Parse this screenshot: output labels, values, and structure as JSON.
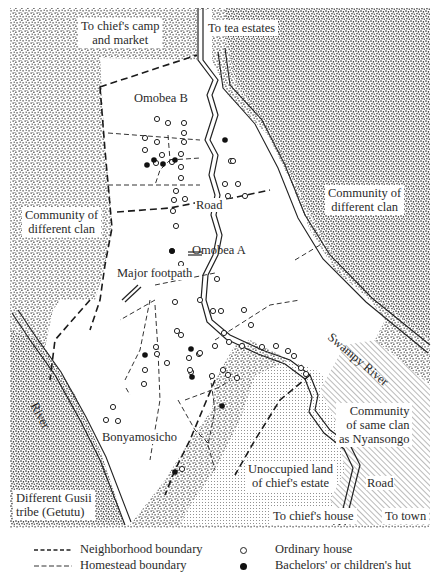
{
  "map": {
    "regions": {
      "top_left_label": "To chief's camp\nand market",
      "top_right_label": "To tea estates",
      "left_community": "Community of\ndifferent clan",
      "right_community": "Community of\ndifferent clan",
      "same_clan": "Community\nof same clan\nas Nyansongo",
      "unoccupied": "Unoccupied land\nof chief's estate",
      "to_chiefs_house": "To chief's house",
      "to_town": "To town",
      "gusii_tribe": "Different Gusii\ntribe (Getutu)"
    },
    "neighborhoods": {
      "omobea_b": "Omobea B",
      "omobea_a": "Omobea A",
      "bonyamosicho": "Bonyamosicho"
    },
    "features": {
      "road_upper": "Road",
      "road_lower": "Road",
      "major_footpath": "Major footpath",
      "swampy_river": "Swampy River",
      "river": "River"
    },
    "colors": {
      "ink": "#1a1a1a",
      "paper": "#ffffff"
    }
  },
  "legend": {
    "neighborhood_boundary": "Neighborhood boundary",
    "homestead_boundary": "Homestead boundary",
    "ordinary_house": "Ordinary house",
    "bachelors_hut": "Bachelors' or children's hut"
  },
  "houses": {
    "ordinary": [
      [
        157,
        119
      ],
      [
        168,
        123
      ],
      [
        184,
        123
      ],
      [
        184,
        133
      ],
      [
        145,
        138
      ],
      [
        157,
        142
      ],
      [
        184,
        142
      ],
      [
        145,
        150
      ],
      [
        162,
        155
      ],
      [
        181,
        154
      ],
      [
        156,
        163
      ],
      [
        172,
        162
      ],
      [
        181,
        167
      ],
      [
        181,
        178
      ],
      [
        176,
        191
      ],
      [
        174,
        200
      ],
      [
        185,
        199
      ],
      [
        173,
        211
      ],
      [
        231,
        161
      ],
      [
        233,
        161
      ],
      [
        225,
        184
      ],
      [
        238,
        184
      ],
      [
        228,
        196
      ],
      [
        245,
        196
      ],
      [
        176,
        226
      ],
      [
        172,
        251
      ],
      [
        181,
        264
      ],
      [
        217,
        279
      ],
      [
        200,
        300
      ],
      [
        175,
        302
      ],
      [
        177,
        331
      ],
      [
        181,
        335
      ],
      [
        213,
        311
      ],
      [
        221,
        311
      ],
      [
        157,
        354
      ],
      [
        167,
        363
      ],
      [
        215,
        346
      ],
      [
        199,
        354
      ],
      [
        229,
        342
      ],
      [
        223,
        370
      ],
      [
        228,
        375
      ],
      [
        212,
        376
      ],
      [
        200,
        353
      ],
      [
        191,
        372
      ],
      [
        189,
        358
      ],
      [
        190,
        370
      ],
      [
        244,
        310
      ],
      [
        251,
        325
      ],
      [
        262,
        347
      ],
      [
        276,
        346
      ],
      [
        288,
        351
      ],
      [
        294,
        356
      ],
      [
        301,
        368
      ],
      [
        306,
        374
      ],
      [
        156,
        347
      ],
      [
        145,
        370
      ],
      [
        144,
        384
      ],
      [
        113,
        407
      ],
      [
        106,
        420
      ],
      [
        118,
        421
      ],
      [
        237,
        378
      ],
      [
        182,
        469
      ],
      [
        224,
        333
      ],
      [
        242,
        346
      ]
    ],
    "bachelor": [
      [
        147,
        165
      ],
      [
        163,
        164
      ],
      [
        175,
        160
      ],
      [
        154,
        160
      ],
      [
        225,
        140
      ],
      [
        172,
        251
      ],
      [
        145,
        355
      ],
      [
        191,
        349
      ],
      [
        192,
        377
      ],
      [
        222,
        406
      ],
      [
        175,
        472
      ]
    ]
  }
}
